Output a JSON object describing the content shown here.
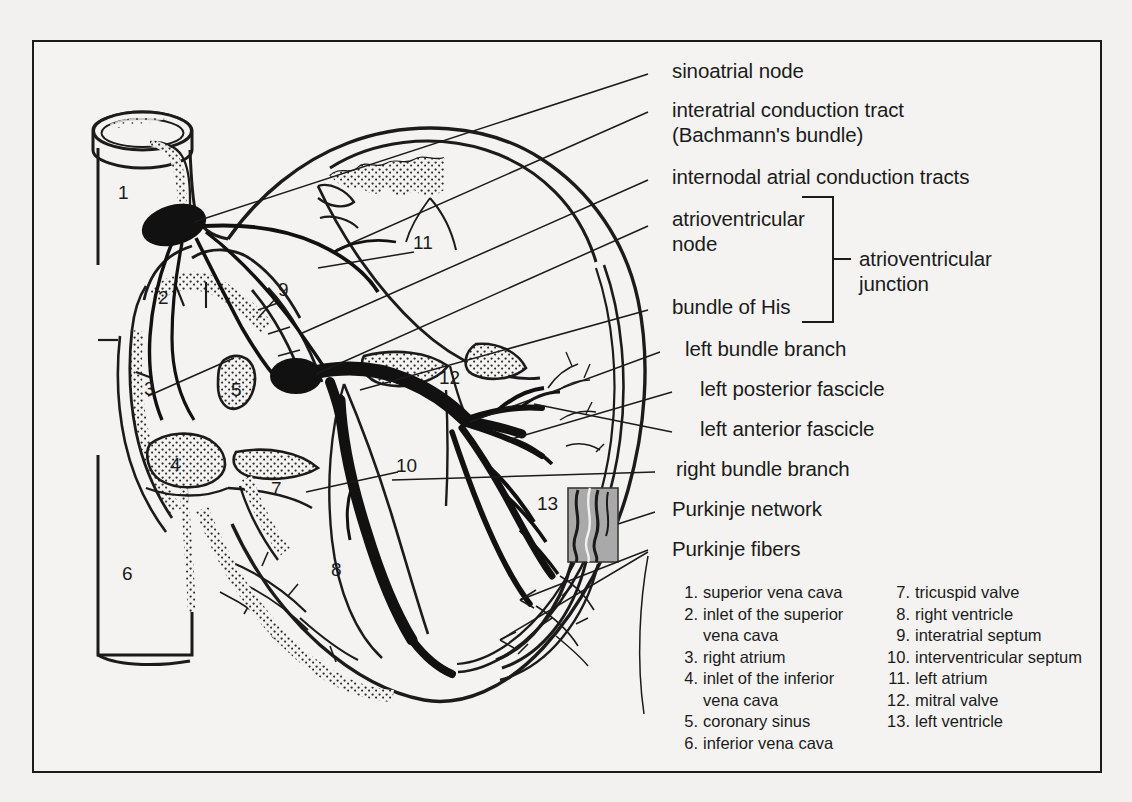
{
  "figure": {
    "background_color": "#f2f1ef",
    "panel_color": "#f4f3f1",
    "border_color": "#1b1b1b",
    "ink_color": "#1b1b1b",
    "inset_fill_color": "#a9a9a9"
  },
  "callouts": [
    {
      "id": "sinoatrial-node",
      "text": "sinoatrial node"
    },
    {
      "id": "interatrial-tract-l1",
      "text": "interatrial conduction tract"
    },
    {
      "id": "interatrial-tract-l2",
      "text": "(Bachmann's bundle)"
    },
    {
      "id": "internodal-tracts",
      "text": "internodal atrial conduction tracts"
    },
    {
      "id": "av-node-l1",
      "text": "atrioventricular"
    },
    {
      "id": "av-node-l2",
      "text": "node"
    },
    {
      "id": "bundle-of-his",
      "text": "bundle of His"
    },
    {
      "id": "av-junction-l1",
      "text": "atrioventricular"
    },
    {
      "id": "av-junction-l2",
      "text": "junction"
    },
    {
      "id": "left-bundle-branch",
      "text": "left bundle branch"
    },
    {
      "id": "left-posterior-fascicle",
      "text": "left posterior fascicle"
    },
    {
      "id": "left-anterior-fascicle",
      "text": "left anterior fascicle"
    },
    {
      "id": "right-bundle-branch",
      "text": "right bundle branch"
    },
    {
      "id": "purkinje-network",
      "text": "Purkinje network"
    },
    {
      "id": "purkinje-fibers",
      "text": "Purkinje fibers"
    }
  ],
  "legend": {
    "left_column": [
      {
        "num": "1.",
        "text": "superior vena cava"
      },
      {
        "num": "2.",
        "text": "inlet of the superior"
      },
      {
        "num": "",
        "text": "vena cava"
      },
      {
        "num": "3.",
        "text": "right atrium"
      },
      {
        "num": "4.",
        "text": "inlet of the inferior"
      },
      {
        "num": "",
        "text": "vena cava"
      },
      {
        "num": "5.",
        "text": "coronary sinus"
      },
      {
        "num": "6.",
        "text": "inferior vena cava"
      }
    ],
    "right_column": [
      {
        "num": "7.",
        "text": "tricuspid valve"
      },
      {
        "num": "8.",
        "text": "right ventricle"
      },
      {
        "num": "9.",
        "text": "interatrial septum"
      },
      {
        "num": "10.",
        "text": "interventricular septum"
      },
      {
        "num": "11.",
        "text": "left atrium"
      },
      {
        "num": "12.",
        "text": "mitral valve"
      },
      {
        "num": "13.",
        "text": "left ventricle"
      }
    ]
  },
  "diagram_markers": [
    {
      "label": "1",
      "x": 124,
      "y": 193
    },
    {
      "label": "2",
      "x": 164,
      "y": 298
    },
    {
      "label": "3",
      "x": 150,
      "y": 389
    },
    {
      "label": "4",
      "x": 176,
      "y": 465
    },
    {
      "label": "5",
      "x": 237,
      "y": 390
    },
    {
      "label": "6",
      "x": 128,
      "y": 574
    },
    {
      "label": "7",
      "x": 277,
      "y": 489
    },
    {
      "label": "8",
      "x": 337,
      "y": 570
    },
    {
      "label": "9",
      "x": 284,
      "y": 290
    },
    {
      "label": "10",
      "x": 404,
      "y": 466
    },
    {
      "label": "11",
      "x": 421,
      "y": 243
    },
    {
      "label": "12",
      "x": 447,
      "y": 378
    },
    {
      "label": "13",
      "x": 545,
      "y": 504
    }
  ]
}
